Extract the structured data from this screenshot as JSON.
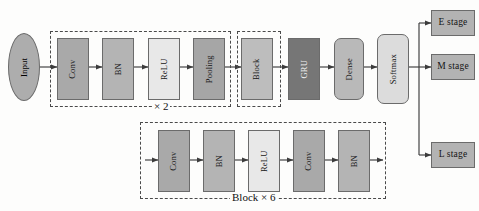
{
  "diagram": {
    "colors": {
      "conv_fill": "#a9a9a9",
      "bn_fill": "#b4b4b4",
      "relu_fill": "#e8e8e8",
      "pooling_fill": "#a6a6a6",
      "block_fill": "#bdbdbd",
      "gru_fill": "#767676",
      "dense_fill": "#b9b9b9",
      "softmax_fill": "#dcdcdc",
      "stage_fill": "#b3b3b3",
      "input_fill": "#adadad",
      "stroke": "#6b6b6b",
      "dashed_stroke": "#4a4a4a",
      "arrow": "#3c3c3c",
      "background": "#fdfdfc"
    },
    "input": {
      "label": "Input"
    },
    "main_row": {
      "conv_block": {
        "nodes": [
          {
            "label": "Conv"
          },
          {
            "label": "BN"
          },
          {
            "label": "ReLU"
          },
          {
            "label": "Pooling"
          }
        ],
        "repeat_label": "× 2"
      },
      "block_group": {
        "nodes": [
          {
            "label": "Block"
          }
        ]
      },
      "tail_nodes": [
        {
          "label": "GRU"
        },
        {
          "label": "Dense"
        },
        {
          "label": "Softmax"
        }
      ]
    },
    "outputs": [
      {
        "label": "E stage"
      },
      {
        "label": "M stage"
      },
      {
        "label": "L stage"
      }
    ],
    "block_detail": {
      "nodes": [
        {
          "label": "Conv"
        },
        {
          "label": "BN"
        },
        {
          "label": "ReLU"
        },
        {
          "label": "Conv"
        },
        {
          "label": "BN"
        }
      ],
      "repeat_label": "Block × 6"
    }
  }
}
